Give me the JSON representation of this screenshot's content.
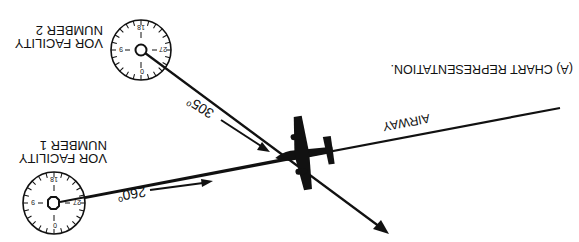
{
  "figure": {
    "caption": "(A) CHART REPRESENTATION.",
    "orientation": "rotated 180 degrees",
    "airway_label": "AIRWAY",
    "vor1": {
      "label_line1": "VOR FACILITY",
      "label_line2": "NUMBER 1",
      "radial": "260",
      "degree_symbol": "o",
      "dial_marks": [
        "0",
        "9",
        "18",
        "27"
      ]
    },
    "vor2": {
      "label_line1": "VOR FACILITY",
      "label_line2": "NUMBER 2",
      "radial": "305",
      "degree_symbol": "o",
      "dial_marks": [
        "0",
        "9",
        "18",
        "27"
      ]
    },
    "colors": {
      "ink": "#111111",
      "background": "#ffffff"
    }
  }
}
